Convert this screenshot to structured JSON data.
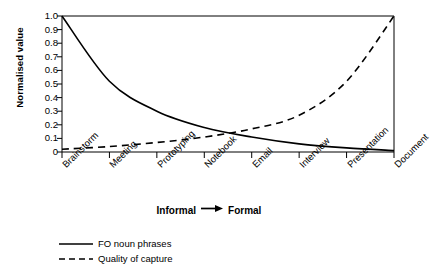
{
  "chart_data": {
    "type": "line",
    "title": "",
    "xlabel": "Informal → Formal",
    "ylabel": "Normalised value",
    "categories": [
      "Brainstorm",
      "Meeting",
      "Prototyping",
      "Notebook",
      "Email",
      "Interview",
      "Presentation",
      "Document"
    ],
    "ylim": [
      0,
      1.0
    ],
    "ytick_labels": [
      "1.0",
      "0.9",
      "0.8",
      "0.7",
      "0.6",
      "0.5",
      "0.4",
      "0.3",
      "0.2",
      "0.1",
      "0"
    ],
    "ytick_values": [
      1.0,
      0.9,
      0.8,
      0.7,
      0.6,
      0.5,
      0.4,
      0.3,
      0.2,
      0.1,
      0
    ],
    "grid": false,
    "legend_position": "below-left",
    "series": [
      {
        "name": "FO noun phrases",
        "style": "solid",
        "color": "#000000",
        "values": [
          1.0,
          0.52,
          0.3,
          0.18,
          0.11,
          0.06,
          0.03,
          0.01
        ]
      },
      {
        "name": "Quality of capture",
        "style": "dashed",
        "color": "#000000",
        "values": [
          0.02,
          0.04,
          0.07,
          0.11,
          0.17,
          0.27,
          0.52,
          1.0
        ]
      }
    ],
    "axis_color": "#000000",
    "background": "#ffffff"
  },
  "axis": {
    "y_title": "Normalised value",
    "x_title_left": "Informal",
    "x_title_arrow": "→",
    "x_title_right": "Formal"
  },
  "legend": {
    "entries": [
      {
        "label": "FO noun phrases",
        "style": "solid"
      },
      {
        "label": "Quality of capture",
        "style": "dashed"
      }
    ]
  }
}
